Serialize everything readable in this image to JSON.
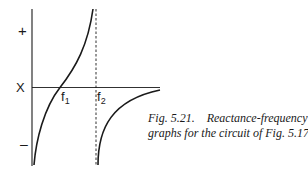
{
  "diagram": {
    "type": "reactance-frequency graph",
    "y_axis": {
      "label": "X",
      "positive_label": "+",
      "negative_label": "–"
    },
    "x_axis_markers": [
      {
        "name": "f1",
        "base": "f",
        "sub": "1"
      },
      {
        "name": "f2",
        "base": "f",
        "sub": "2"
      }
    ],
    "curves": [
      {
        "name": "curve-below-f2",
        "description": "rises from -inf through zero at f1 to +inf approaching f2"
      },
      {
        "name": "curve-above-f2",
        "description": "rises from -inf at f2 asymptotically toward zero"
      }
    ],
    "asymptote": {
      "at": "f2",
      "style": "dashed"
    }
  },
  "caption": {
    "line1": "Fig. 5.21.    Reactance-frequency",
    "line2": "graphs for the circuit of Fig. 5.17"
  },
  "colors": {
    "ink": "#1a1a1a",
    "background": "#ffffff"
  }
}
